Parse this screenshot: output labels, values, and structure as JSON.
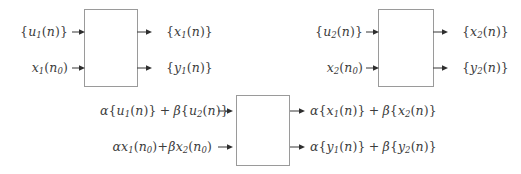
{
  "figure": {
    "type": "block-diagram",
    "background_color": "#ffffff",
    "line_color": "#9a9a9a",
    "text_color": "#3c3c3c",
    "width": 521,
    "height": 174
  },
  "blocks": [
    {
      "id": "system-1",
      "x": 84,
      "y": 9,
      "w": 54,
      "h": 78,
      "label": ""
    },
    {
      "id": "system-2",
      "x": 378,
      "y": 9,
      "w": 56,
      "h": 78,
      "label": ""
    },
    {
      "id": "system-3",
      "x": 236,
      "y": 95,
      "w": 54,
      "h": 71,
      "label": ""
    }
  ],
  "block1": {
    "inputs": [
      {
        "id": "in-u1",
        "text": "{u₁(n)}"
      },
      {
        "id": "in-x1n0",
        "text": "x₁(n₀)"
      }
    ],
    "outputs": [
      {
        "id": "out-x1",
        "text": "{x₁(n)}"
      },
      {
        "id": "out-y1",
        "text": "{y₁(n)}"
      }
    ]
  },
  "block2": {
    "inputs": [
      {
        "id": "in-u2",
        "text": "{u₂(n)}"
      },
      {
        "id": "in-x2n0",
        "text": "x₂(n₀)"
      }
    ],
    "outputs": [
      {
        "id": "out-x2",
        "text": "{x₂(n)}"
      },
      {
        "id": "out-y2",
        "text": "{y₂(n)}"
      }
    ]
  },
  "block3": {
    "inputs": [
      {
        "id": "in-alpha-u1-beta-u2",
        "text": "α{u₁(n)} + β{u₂(n)}"
      },
      {
        "id": "in-alpha-x1n0-beta-x2n0",
        "text": "αx₁(n₀)+βx₂(n₀)"
      }
    ],
    "outputs": [
      {
        "id": "out-alpha-x1-beta-x2",
        "text": "α{x₁(n)} + β{x₂(n)}"
      },
      {
        "id": "out-alpha-y1-beta-y2",
        "text": "α{y₁(n)} + β{y₂(n)}"
      }
    ]
  },
  "symbols": {
    "alpha": "α",
    "beta": "β",
    "plus": "+",
    "brace_open": "{",
    "brace_close": "}",
    "paren_open": "(",
    "paren_close": ")",
    "n": "n",
    "n0": "n₀",
    "u": "u",
    "x": "x",
    "y": "y",
    "sub1": "1",
    "sub2": "2"
  }
}
